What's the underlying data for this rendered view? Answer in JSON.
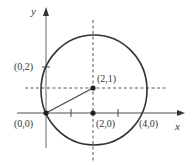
{
  "diagram": {
    "type": "circle-on-coordinate-axes",
    "axes": {
      "x_label": "x",
      "y_label": "y"
    },
    "circle": {
      "center_label": "(2,1)",
      "passes_through": [
        "(0,0)",
        "(0,2)",
        "(4,0)"
      ]
    },
    "points": [
      {
        "label": "(0,0)",
        "filled": true
      },
      {
        "label": "(2,1)",
        "filled": true
      },
      {
        "label": "(2,0)",
        "filled": true
      }
    ],
    "ticks": [
      {
        "label": "(0,2)",
        "axis": "y"
      },
      {
        "label": "(4,0)",
        "axis": "x"
      }
    ],
    "colors": {
      "axis": "#8a8a8a",
      "curve": "#333333",
      "dashed": "#555555",
      "point": "#222222"
    }
  }
}
